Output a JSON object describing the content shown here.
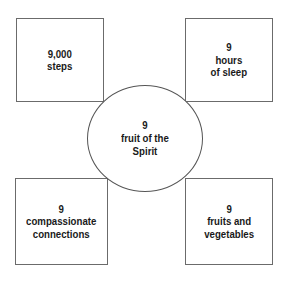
{
  "diagram": {
    "clipped_top_text": "·                                 ·",
    "center": {
      "label": "9\nfruit of the\nSpirit",
      "count": "9",
      "name": "fruit of the Spirit"
    },
    "boxes": [
      {
        "position": "top-left",
        "label": "9,000\nsteps",
        "count": "9,000",
        "name": "steps"
      },
      {
        "position": "top-right",
        "label": "9\nhours\nof sleep",
        "count": "9",
        "name": "hours of sleep"
      },
      {
        "position": "bottom-left",
        "label": "9\ncompassionate\nconnections",
        "count": "9",
        "name": "compassionate connections"
      },
      {
        "position": "bottom-right",
        "label": "9\nfruits and\nvegetables",
        "count": "9",
        "name": "fruits and vegetables"
      }
    ],
    "colors": {
      "background": "#ffffff",
      "box_border": "#6b6b6b",
      "circle_border": "#555555",
      "text": "#1a1a1a"
    }
  }
}
